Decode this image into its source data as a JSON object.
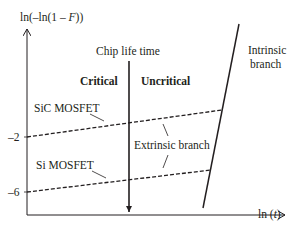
{
  "diagram": {
    "y_axis": {
      "label_prefix": "ln(–ln(1 – ",
      "label_var": "F",
      "label_suffix": "))"
    },
    "x_axis": {
      "label_prefix": "ln (",
      "label_var": "t",
      "label_suffix": ")"
    },
    "ticks": [
      {
        "label": "–2",
        "y": 137
      },
      {
        "label": "–6",
        "y": 192
      }
    ],
    "chip_life_time_label": "Chip life time",
    "region_left_label": "Critical",
    "region_right_label": "Uncritical",
    "series": [
      {
        "name": "SiC MOSFET",
        "style": "dashed"
      },
      {
        "name": "Si MOSFET",
        "style": "dashed"
      }
    ],
    "extrinsic_label": "Extrinsic branch",
    "intrinsic_label_line1": "Intrinsic",
    "intrinsic_label_line2": "branch",
    "colors": {
      "ink": "#231f20",
      "background": "#ffffff"
    }
  }
}
